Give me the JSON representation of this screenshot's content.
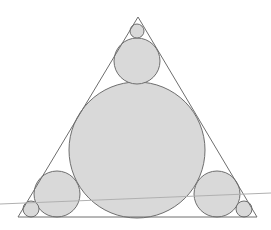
{
  "diagram": {
    "title": "Circles inscribed in an equilateral triangle",
    "colors": {
      "background": "#ffffff",
      "circle_fill": "#d9d9d9",
      "stroke": "#6e6e6e",
      "stray_line": "#b0b0b0"
    },
    "triangle": {
      "points": [
        [
          138,
          17
        ],
        [
          18,
          217
        ],
        [
          257,
          217
        ]
      ]
    },
    "circles": [
      {
        "id": "center-large",
        "cx": 137,
        "cy": 150,
        "r": 68
      },
      {
        "id": "top-medium",
        "cx": 137,
        "cy": 61,
        "r": 23
      },
      {
        "id": "top-small",
        "cx": 137,
        "cy": 31,
        "r": 7
      },
      {
        "id": "bottom-left-medium",
        "cx": 57,
        "cy": 194,
        "r": 23
      },
      {
        "id": "bottom-left-small",
        "cx": 31,
        "cy": 209,
        "r": 8
      },
      {
        "id": "bottom-right-medium",
        "cx": 217,
        "cy": 194,
        "r": 23
      },
      {
        "id": "bottom-right-small",
        "cx": 244,
        "cy": 209,
        "r": 8
      }
    ],
    "stray_line": {
      "x1": 0,
      "y1": 204,
      "x2": 271,
      "y2": 193
    }
  }
}
